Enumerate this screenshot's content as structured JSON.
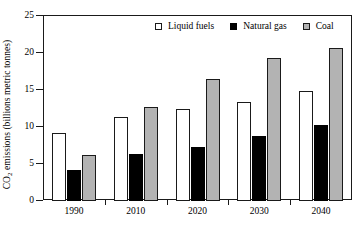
{
  "chart_data": {
    "type": "bar",
    "title": "",
    "subtitle": "",
    "xlabel": "",
    "ylabel": "CO2 emissions (billions metric tonnes)",
    "ylabel_prefix": "CO",
    "ylabel_subscript": "2",
    "ylabel_suffix": " emissions (billions metric tonnes)",
    "categories": [
      "1990",
      "2010",
      "2020",
      "2030",
      "2040"
    ],
    "series": [
      {
        "name": "Liquid fuels",
        "color": "#ffffff",
        "values": [
          9.1,
          11.2,
          12.3,
          13.3,
          14.7
        ]
      },
      {
        "name": "Natural gas",
        "color": "#000000",
        "values": [
          4.0,
          6.2,
          7.2,
          8.6,
          10.1
        ]
      },
      {
        "name": "Coal",
        "color": "#b3b3b3",
        "values": [
          6.1,
          12.6,
          16.4,
          19.2,
          20.6
        ]
      }
    ],
    "ylim": [
      0,
      25
    ],
    "yticks": [
      0,
      5,
      10,
      15,
      20,
      25
    ],
    "ytick_labels": [
      "0",
      "5",
      "10",
      "15",
      "20",
      "25"
    ],
    "grid": false,
    "legend_position": "top-right",
    "frame": true
  },
  "axis": {
    "y_title": "CO2 emissions (billions metric tonnes)"
  },
  "legend": {
    "items": [
      {
        "label": "Liquid fuels",
        "swatch": "open-square-swatch"
      },
      {
        "label": "Natural gas",
        "swatch": "filled-square-swatch"
      },
      {
        "label": "Coal",
        "swatch": "gray-square-swatch"
      }
    ]
  }
}
